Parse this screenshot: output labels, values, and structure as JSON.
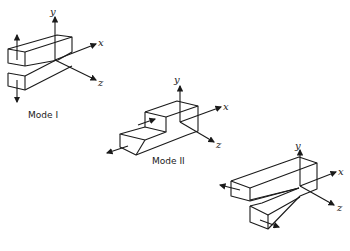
{
  "diagram": {
    "modes": [
      {
        "label": "Mode I",
        "axes": {
          "x": "x",
          "y": "y",
          "z": "z"
        }
      },
      {
        "label": "Mode II",
        "axes": {
          "x": "x",
          "y": "y",
          "z": "z"
        }
      },
      {
        "label": "",
        "axes": {
          "x": "x",
          "y": "y",
          "z": "z"
        }
      }
    ]
  }
}
